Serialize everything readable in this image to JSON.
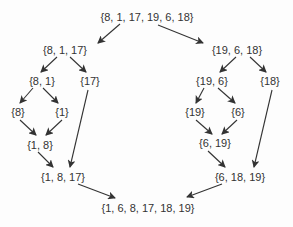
{
  "colors": {
    "text": "#333333",
    "arrow": "#333333",
    "background": "#fdfdfd"
  },
  "nodes": [
    {
      "id": "root",
      "label": "{8, 1, 17, 19, 6, 18}",
      "x": 147,
      "y": 17
    },
    {
      "id": "left",
      "label": "{8, 1, 17}",
      "x": 65,
      "y": 50
    },
    {
      "id": "right",
      "label": "{19, 6, 18}",
      "x": 237,
      "y": 50
    },
    {
      "id": "l1",
      "label": "{8, 1}",
      "x": 42,
      "y": 81
    },
    {
      "id": "l2",
      "label": "{17}",
      "x": 90,
      "y": 81
    },
    {
      "id": "r1",
      "label": "{19, 6}",
      "x": 212,
      "y": 81
    },
    {
      "id": "r2",
      "label": "{18}",
      "x": 270,
      "y": 81
    },
    {
      "id": "l1a",
      "label": "{8}",
      "x": 18,
      "y": 112
    },
    {
      "id": "l1b",
      "label": "{1}",
      "x": 62,
      "y": 112
    },
    {
      "id": "r1a",
      "label": "{19}",
      "x": 195,
      "y": 112
    },
    {
      "id": "r1b",
      "label": "{6}",
      "x": 238,
      "y": 112
    },
    {
      "id": "lm1",
      "label": "{1, 8}",
      "x": 40,
      "y": 145
    },
    {
      "id": "rm1",
      "label": "{6, 19}",
      "x": 215,
      "y": 143
    },
    {
      "id": "lm2",
      "label": "{1, 8, 17}",
      "x": 63,
      "y": 177
    },
    {
      "id": "rm2",
      "label": "{6, 18, 19}",
      "x": 240,
      "y": 177
    },
    {
      "id": "result",
      "label": "{1, 6, 8, 17, 18, 19}",
      "x": 148,
      "y": 208
    }
  ],
  "edges": [
    {
      "from": "root",
      "to": "left",
      "x1": 120,
      "y1": 24,
      "x2": 98,
      "y2": 43
    },
    {
      "from": "root",
      "to": "right",
      "x1": 158,
      "y1": 25,
      "x2": 203,
      "y2": 43
    },
    {
      "from": "left",
      "to": "l1",
      "x1": 57,
      "y1": 57,
      "x2": 41,
      "y2": 72
    },
    {
      "from": "left",
      "to": "l2",
      "x1": 70,
      "y1": 57,
      "x2": 86,
      "y2": 72
    },
    {
      "from": "right",
      "to": "r1",
      "x1": 236,
      "y1": 57,
      "x2": 220,
      "y2": 72
    },
    {
      "from": "right",
      "to": "r2",
      "x1": 250,
      "y1": 57,
      "x2": 266,
      "y2": 72
    },
    {
      "from": "l1",
      "to": "l1a",
      "x1": 33,
      "y1": 88,
      "x2": 20,
      "y2": 103
    },
    {
      "from": "l1",
      "to": "l1b",
      "x1": 43,
      "y1": 88,
      "x2": 58,
      "y2": 103
    },
    {
      "from": "r1",
      "to": "r1a",
      "x1": 204,
      "y1": 88,
      "x2": 196,
      "y2": 103
    },
    {
      "from": "r1",
      "to": "r1b",
      "x1": 218,
      "y1": 88,
      "x2": 235,
      "y2": 103
    },
    {
      "from": "l1a",
      "to": "lm1",
      "x1": 20,
      "y1": 120,
      "x2": 36,
      "y2": 135
    },
    {
      "from": "l1b",
      "to": "lm1",
      "x1": 62,
      "y1": 120,
      "x2": 46,
      "y2": 135
    },
    {
      "from": "r1a",
      "to": "rm1",
      "x1": 196,
      "y1": 120,
      "x2": 212,
      "y2": 134
    },
    {
      "from": "r1b",
      "to": "rm1",
      "x1": 237,
      "y1": 120,
      "x2": 222,
      "y2": 134
    },
    {
      "from": "l2",
      "to": "lm2",
      "x1": 88,
      "y1": 90,
      "x2": 70,
      "y2": 167
    },
    {
      "from": "lm1",
      "to": "lm2",
      "x1": 38,
      "y1": 152,
      "x2": 53,
      "y2": 167
    },
    {
      "from": "r2",
      "to": "rm2",
      "x1": 272,
      "y1": 90,
      "x2": 254,
      "y2": 167
    },
    {
      "from": "rm1",
      "to": "rm2",
      "x1": 208,
      "y1": 151,
      "x2": 225,
      "y2": 167
    },
    {
      "from": "lm2",
      "to": "result",
      "x1": 78,
      "y1": 184,
      "x2": 115,
      "y2": 198
    },
    {
      "from": "rm2",
      "to": "result",
      "x1": 222,
      "y1": 184,
      "x2": 187,
      "y2": 197
    }
  ]
}
